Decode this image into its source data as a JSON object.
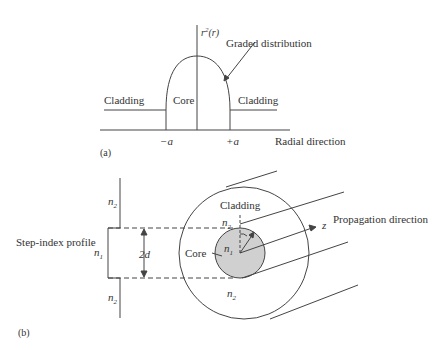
{
  "panel_a": {
    "label": "(a)",
    "y_axis_label": "r²(r)",
    "y_axis_label_base": "r",
    "y_axis_label_sup": "2",
    "y_axis_label_arg": "(r)",
    "annotation": "Graded distribution",
    "left_region": "Cladding",
    "center_region": "Core",
    "right_region": "Cladding",
    "tick_minus": "−a",
    "tick_plus": "+a",
    "x_axis_label": "Radial direction"
  },
  "panel_b": {
    "label": "(b)",
    "profile_label": "Step-index profile",
    "n2_top": "n2",
    "n1_profile": "n1",
    "n2_bottom": "n2",
    "diameter_label": "2d",
    "cladding_label": "Cladding",
    "n2_cladding_top": "n2",
    "n1_core": "n1",
    "core_label": "Core",
    "n2_cladding_bottom": "n2",
    "z_label": "z",
    "propagation_label": "Propagation direction",
    "sub_n": "n",
    "sub_1": "1",
    "sub_2": "2"
  },
  "colors": {
    "line": "#444444",
    "core_fill": "#d0d0d0",
    "text": "#333333"
  }
}
